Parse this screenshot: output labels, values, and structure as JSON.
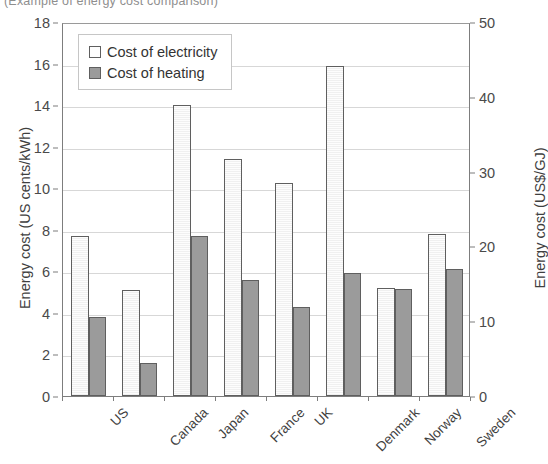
{
  "clipped_title": "(Example of energy cost comparison)",
  "chart_data": {
    "type": "bar",
    "title": "",
    "categories": [
      "US",
      "Canada",
      "Japan",
      "France",
      "UK",
      "Denmark",
      "Norway",
      "Sweden"
    ],
    "series": [
      {
        "name": "Cost of electricity",
        "values": [
          7.7,
          5.1,
          14.0,
          11.4,
          10.25,
          15.9,
          5.2,
          7.8
        ]
      },
      {
        "name": "Cost of heating",
        "values": [
          3.8,
          1.6,
          7.7,
          5.6,
          4.3,
          5.9,
          5.15,
          6.1
        ]
      }
    ],
    "xlabel": "",
    "ylabel": "Energy cost (US cents/kWh)",
    "ylabel_right": "Energy cost (US$/GJ)",
    "ylim": [
      0,
      18
    ],
    "ylim_right": [
      0,
      50
    ],
    "yticks": [
      0,
      2,
      4,
      6,
      8,
      10,
      12,
      14,
      16,
      18
    ],
    "yticks_right": [
      0,
      10,
      20,
      30,
      40,
      50
    ],
    "grid": true,
    "legend_position": "top-left",
    "colors": {
      "electricity": "#fdfdfd",
      "heating": "#9b9b9b",
      "outline": "#5f5f5f",
      "gridline": "#d7d7d7",
      "axis": "#7d7d7d"
    }
  }
}
